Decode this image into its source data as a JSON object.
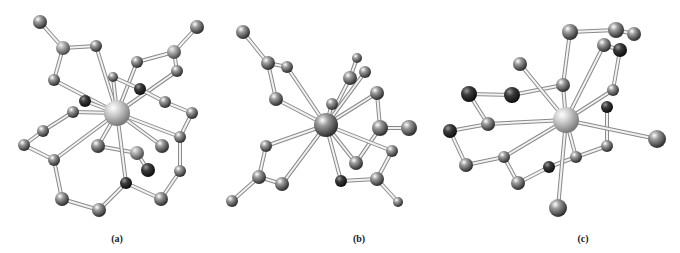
{
  "figure": {
    "panels": [
      {
        "id": "a",
        "label": "(a)",
        "label_pos": [
          117,
          239
        ],
        "metal": {
          "x": 117,
          "y": 113,
          "r": 13,
          "color": "#c8c8c8"
        },
        "atoms": [
          [
            40,
            22,
            7,
            "#777"
          ],
          [
            63,
            48,
            7,
            "#9a9a9a"
          ],
          [
            96,
            46,
            6,
            "#777"
          ],
          [
            54,
            80,
            6,
            "#777"
          ],
          [
            197,
            27,
            7,
            "#777"
          ],
          [
            174,
            52,
            7,
            "#9a9a9a"
          ],
          [
            137,
            62,
            6,
            "#777"
          ],
          [
            177,
            71,
            6,
            "#777"
          ],
          [
            113,
            77,
            5,
            "#777"
          ],
          [
            140,
            89,
            6,
            "#333"
          ],
          [
            85,
            101,
            6,
            "#333"
          ],
          [
            73,
            112,
            6,
            "#777"
          ],
          [
            165,
            102,
            6,
            "#777"
          ],
          [
            192,
            113,
            6,
            "#777"
          ],
          [
            43,
            131,
            6,
            "#777"
          ],
          [
            24,
            145,
            6,
            "#777"
          ],
          [
            54,
            160,
            6,
            "#777"
          ],
          [
            180,
            137,
            6,
            "#777"
          ],
          [
            98,
            146,
            7,
            "#777"
          ],
          [
            137,
            153,
            7,
            "#888"
          ],
          [
            162,
            146,
            7,
            "#777"
          ],
          [
            148,
            170,
            7,
            "#555"
          ],
          [
            180,
            171,
            6,
            "#777"
          ],
          [
            126,
            183,
            6,
            "#555"
          ],
          [
            62,
            199,
            7,
            "#777"
          ],
          [
            99,
            210,
            7,
            "#777"
          ],
          [
            161,
            199,
            7,
            "#777"
          ]
        ],
        "bonds": [
          [
            40,
            22,
            63,
            48
          ],
          [
            63,
            48,
            96,
            46
          ],
          [
            63,
            48,
            54,
            80
          ],
          [
            96,
            46,
            117,
            113
          ],
          [
            54,
            80,
            117,
            113
          ],
          [
            197,
            27,
            174,
            52
          ],
          [
            174,
            52,
            137,
            62
          ],
          [
            174,
            52,
            177,
            71
          ],
          [
            137,
            62,
            117,
            113
          ],
          [
            177,
            71,
            117,
            113
          ],
          [
            113,
            77,
            117,
            113
          ],
          [
            113,
            77,
            140,
            89
          ],
          [
            140,
            89,
            165,
            102
          ],
          [
            165,
            102,
            192,
            113
          ],
          [
            192,
            113,
            180,
            137
          ],
          [
            180,
            137,
            180,
            171
          ],
          [
            180,
            171,
            161,
            199
          ],
          [
            161,
            199,
            126,
            183
          ],
          [
            126,
            183,
            99,
            210
          ],
          [
            99,
            210,
            62,
            199
          ],
          [
            62,
            199,
            54,
            160
          ],
          [
            54,
            160,
            24,
            145
          ],
          [
            24,
            145,
            43,
            131
          ],
          [
            43,
            131,
            73,
            112
          ],
          [
            73,
            112,
            117,
            113
          ],
          [
            54,
            160,
            117,
            113
          ],
          [
            98,
            146,
            137,
            153
          ],
          [
            137,
            153,
            148,
            170
          ],
          [
            98,
            146,
            117,
            113
          ],
          [
            162,
            146,
            117,
            113
          ],
          [
            180,
            137,
            117,
            113
          ],
          [
            126,
            183,
            117,
            113
          ],
          [
            85,
            101,
            117,
            113
          ]
        ]
      },
      {
        "id": "b",
        "label": "(b)",
        "label_pos": [
          359,
          239
        ],
        "metal": {
          "x": 326,
          "y": 125,
          "r": 12,
          "color": "#666"
        },
        "atoms": [
          [
            243,
            32,
            7,
            "#777"
          ],
          [
            268,
            63,
            7,
            "#777"
          ],
          [
            287,
            67,
            6,
            "#777"
          ],
          [
            276,
            99,
            7,
            "#777"
          ],
          [
            357,
            58,
            5,
            "#777"
          ],
          [
            350,
            78,
            7,
            "#777"
          ],
          [
            365,
            72,
            6,
            "#777"
          ],
          [
            332,
            104,
            6,
            "#777"
          ],
          [
            377,
            93,
            7,
            "#777"
          ],
          [
            380,
            128,
            8,
            "#777"
          ],
          [
            409,
            128,
            8,
            "#777"
          ],
          [
            392,
            151,
            6,
            "#777"
          ],
          [
            356,
            163,
            7,
            "#777"
          ],
          [
            266,
            146,
            6,
            "#777"
          ],
          [
            259,
            177,
            7,
            "#777"
          ],
          [
            282,
            184,
            7,
            "#777"
          ],
          [
            232,
            201,
            6,
            "#777"
          ],
          [
            341,
            181,
            6,
            "#333"
          ],
          [
            377,
            179,
            7,
            "#777"
          ],
          [
            398,
            202,
            5,
            "#777"
          ]
        ],
        "bonds": [
          [
            243,
            32,
            268,
            63
          ],
          [
            268,
            63,
            287,
            67
          ],
          [
            268,
            63,
            276,
            99
          ],
          [
            287,
            67,
            326,
            125
          ],
          [
            276,
            99,
            326,
            125
          ],
          [
            357,
            58,
            350,
            78
          ],
          [
            350,
            78,
            326,
            125
          ],
          [
            365,
            72,
            326,
            125
          ],
          [
            332,
            104,
            326,
            125
          ],
          [
            377,
            93,
            326,
            125
          ],
          [
            377,
            93,
            380,
            128
          ],
          [
            380,
            128,
            409,
            128
          ],
          [
            380,
            128,
            356,
            163
          ],
          [
            356,
            163,
            326,
            125
          ],
          [
            326,
            125,
            392,
            151
          ],
          [
            392,
            151,
            377,
            179
          ],
          [
            377,
            179,
            341,
            181
          ],
          [
            341,
            181,
            326,
            125
          ],
          [
            377,
            179,
            398,
            202
          ],
          [
            266,
            146,
            326,
            125
          ],
          [
            266,
            146,
            259,
            177
          ],
          [
            259,
            177,
            282,
            184
          ],
          [
            282,
            184,
            326,
            125
          ],
          [
            259,
            177,
            232,
            201
          ]
        ]
      },
      {
        "id": "c",
        "label": "(c)",
        "label_pos": [
          583,
          239
        ],
        "metal": {
          "x": 566,
          "y": 120,
          "r": 13,
          "color": "#c8c8c8"
        },
        "atoms": [
          [
            570,
            32,
            8,
            "#777"
          ],
          [
            616,
            30,
            8,
            "#777"
          ],
          [
            634,
            34,
            7,
            "#777"
          ],
          [
            604,
            45,
            7,
            "#777"
          ],
          [
            620,
            50,
            7,
            "#555"
          ],
          [
            520,
            64,
            7,
            "#777"
          ],
          [
            563,
            85,
            7,
            "#777"
          ],
          [
            512,
            95,
            8,
            "#555"
          ],
          [
            469,
            94,
            8,
            "#555"
          ],
          [
            488,
            124,
            7,
            "#777"
          ],
          [
            450,
            131,
            7,
            "#333"
          ],
          [
            613,
            90,
            6,
            "#777"
          ],
          [
            607,
            107,
            6,
            "#333"
          ],
          [
            466,
            165,
            7,
            "#777"
          ],
          [
            504,
            157,
            6,
            "#777"
          ],
          [
            518,
            183,
            7,
            "#777"
          ],
          [
            549,
            167,
            6,
            "#333"
          ],
          [
            576,
            157,
            6,
            "#777"
          ],
          [
            607,
            146,
            6,
            "#777"
          ],
          [
            657,
            139,
            9,
            "#777"
          ],
          [
            558,
            208,
            9,
            "#777"
          ]
        ],
        "bonds": [
          [
            570,
            32,
            616,
            30
          ],
          [
            616,
            30,
            634,
            34
          ],
          [
            604,
            45,
            620,
            50
          ],
          [
            570,
            32,
            563,
            85
          ],
          [
            563,
            85,
            566,
            120
          ],
          [
            604,
            45,
            566,
            120
          ],
          [
            620,
            50,
            613,
            90
          ],
          [
            613,
            90,
            566,
            120
          ],
          [
            563,
            85,
            512,
            95
          ],
          [
            512,
            95,
            469,
            94
          ],
          [
            469,
            94,
            488,
            124
          ],
          [
            488,
            124,
            450,
            131
          ],
          [
            450,
            131,
            466,
            165
          ],
          [
            466,
            165,
            504,
            157
          ],
          [
            504,
            157,
            518,
            183
          ],
          [
            518,
            183,
            549,
            167
          ],
          [
            549,
            167,
            576,
            157
          ],
          [
            576,
            157,
            607,
            146
          ],
          [
            607,
            146,
            607,
            107
          ],
          [
            488,
            124,
            566,
            120
          ],
          [
            504,
            157,
            566,
            120
          ],
          [
            520,
            64,
            566,
            120
          ],
          [
            576,
            157,
            566,
            120
          ],
          [
            566,
            120,
            657,
            139
          ],
          [
            566,
            120,
            558,
            208
          ]
        ]
      }
    ]
  },
  "labels": {
    "a": "(a)",
    "b": "(b)",
    "c": "(c)"
  }
}
